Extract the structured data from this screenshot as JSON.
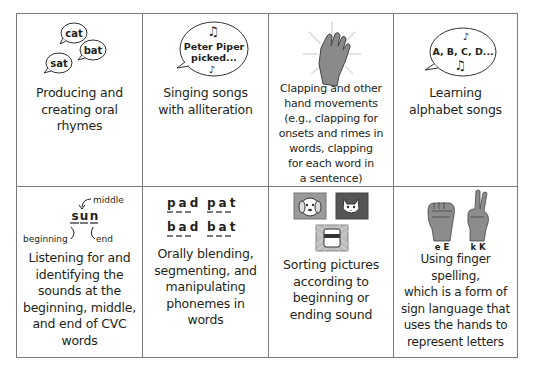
{
  "cells": [
    {
      "id": "oral-rhymes",
      "caption": "Producing and creating oral rhymes",
      "caption_lines": [
        "Producing and",
        "creating oral",
        "rhymes"
      ],
      "illustration": {
        "type": "speech-bubbles",
        "words": [
          "cat",
          "bat",
          "sat"
        ]
      }
    },
    {
      "id": "alliteration-songs",
      "caption": "Singing songs with alliteration",
      "caption_lines": [
        "Singing songs",
        "with alliteration"
      ],
      "illustration": {
        "type": "speech-bubble-music",
        "text_lines": [
          "Peter Piper",
          "picked..."
        ]
      }
    },
    {
      "id": "clapping",
      "caption": "Clapping and other hand movements (e.g., clapping for onsets and rimes in words, clapping for each word in a sentence)",
      "caption_lines": [
        "Clapping and other",
        "hand movements",
        "(e.g., clapping for",
        "onsets and rimes in",
        "words, clapping",
        "for each word in",
        "a sentence)"
      ],
      "illustration": {
        "type": "clapping-hand-icon"
      }
    },
    {
      "id": "alphabet-songs",
      "caption": "Learning alphabet songs",
      "caption_lines": [
        "Learning",
        "alphabet songs"
      ],
      "illustration": {
        "type": "speech-bubble-music",
        "text_lines": [
          "A, B, C, D..."
        ]
      }
    },
    {
      "id": "cvc-sounds",
      "caption": "Listening for and identifying the sounds at the beginning, middle, and end of CVC words",
      "caption_lines": [
        "Listening for and",
        "identifying the",
        "sounds at the",
        "beginning, middle,",
        "and end of CVC",
        "words"
      ],
      "illustration": {
        "type": "cvc-diagram",
        "letters": [
          "s",
          "u",
          "n"
        ],
        "labels": {
          "beginning": "beginning",
          "middle": "middle",
          "end": "end"
        }
      }
    },
    {
      "id": "phonemes",
      "caption": "Orally blending, segmenting, and manipulating phonemes in words",
      "caption_lines": [
        "Orally blending,",
        "segmenting, and",
        "manipulating",
        "phonemes in",
        "words"
      ],
      "illustration": {
        "type": "word-grid",
        "words": [
          "pad",
          "pat",
          "bad",
          "bat"
        ]
      }
    },
    {
      "id": "sorting-pictures",
      "caption": "Sorting pictures according to beginning or ending sound",
      "caption_lines": [
        "Sorting pictures",
        "according to",
        "beginning or",
        "ending sound"
      ],
      "illustration": {
        "type": "picture-cards",
        "pictures": [
          "dog",
          "cat",
          "jar"
        ]
      }
    },
    {
      "id": "finger-spelling",
      "caption": "Using finger spelling, which is a form of sign language that uses the hands to represent letters",
      "caption_lines": [
        "Using finger spelling,",
        "which is a form of",
        "sign language that",
        "uses the hands to",
        "represent letters"
      ],
      "illustration": {
        "type": "sign-hands",
        "hand_labels": [
          "e E",
          "k K"
        ]
      }
    }
  ],
  "colors": {
    "border": "#7a7a7a",
    "icon_gray": "#8c8c8c",
    "icon_dark": "#555555",
    "text": "#231f20"
  }
}
